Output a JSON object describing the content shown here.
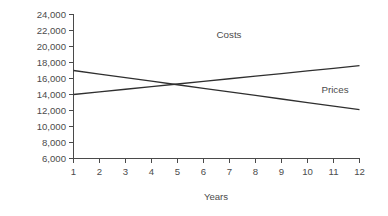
{
  "chart_data": {
    "type": "line",
    "title": "",
    "xlabel": "Years",
    "ylabel": "",
    "x": [
      1,
      2,
      3,
      4,
      5,
      6,
      7,
      8,
      9,
      10,
      11,
      12
    ],
    "categories": [
      "1",
      "2",
      "3",
      "4",
      "5",
      "6",
      "7",
      "8",
      "9",
      "10",
      "11",
      "12"
    ],
    "xlim": [
      1,
      12
    ],
    "ylim": [
      6000,
      24000
    ],
    "ytick_values": [
      6000,
      8000,
      10000,
      12000,
      14000,
      16000,
      18000,
      20000,
      22000,
      24000
    ],
    "ytick_labels": [
      "6,000",
      "8,000",
      "10,000",
      "12,000",
      "14,000",
      "16,000",
      "18,000",
      "20,000",
      "22,000",
      "24,000"
    ],
    "xtick_labels": [
      "1",
      "2",
      "3",
      "4",
      "5",
      "6",
      "7",
      "8",
      "9",
      "10",
      "11",
      "12"
    ],
    "grid": false,
    "legend_position": "inline-annotation",
    "frame": "left-and-bottom-only",
    "markers": false,
    "series": [
      {
        "name": "Costs",
        "color": "#2f2f2f",
        "label_text": "Costs",
        "trend": "increasing",
        "start_value": 14000,
        "end_value": 17600,
        "values": [
          14000,
          14327,
          14655,
          14982,
          15309,
          15636,
          15964,
          16291,
          16618,
          16945,
          17273,
          17600
        ]
      },
      {
        "name": "Prices",
        "color": "#2f2f2f",
        "label_text": "Prices",
        "trend": "decreasing",
        "start_value": 17000,
        "end_value": 12100,
        "values": [
          17000,
          16555,
          16109,
          15664,
          15218,
          14773,
          14327,
          13882,
          13436,
          12991,
          12545,
          12100
        ]
      }
    ],
    "annotations": [
      {
        "text": "Costs",
        "x": 7.0,
        "y": 21200
      },
      {
        "text": "Prices",
        "x": 11.1,
        "y": 15650
      }
    ],
    "intersection": {
      "x": 4.5,
      "y": 15300
    }
  },
  "axis": {
    "x_title": "Years"
  }
}
